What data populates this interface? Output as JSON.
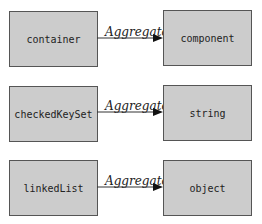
{
  "diagram": {
    "rows": [
      {
        "source": "container",
        "relation": "Aggregate",
        "target": "component"
      },
      {
        "source": "checkedKeySet",
        "relation": "Aggregate",
        "target": "string"
      },
      {
        "source": "linkedList",
        "relation": "Aggregate",
        "target": "object"
      }
    ],
    "colors": {
      "box_fill": "#cccccc",
      "box_border": "#555555",
      "edge": "#333333"
    }
  }
}
